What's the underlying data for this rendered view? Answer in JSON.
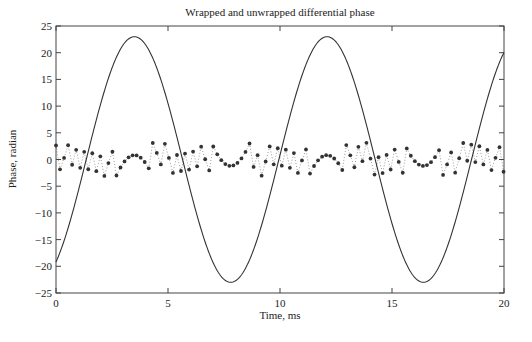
{
  "chart_data": {
    "type": "line",
    "title": "Wrapped and unwrapped differential phase",
    "xlabel": "Time, ms",
    "ylabel": "Phase, radian",
    "xlim": [
      0,
      20
    ],
    "ylim": [
      -25,
      25
    ],
    "xticks": [
      0,
      5,
      10,
      15,
      20
    ],
    "yticks": [
      25,
      20,
      15,
      10,
      5,
      0,
      -5,
      -10,
      -15,
      -20,
      -25
    ],
    "grid": false,
    "legend": null,
    "series": [
      {
        "name": "Unwrapped phase",
        "style": "solid line",
        "color": "#333333",
        "model": {
          "amplitude": 23,
          "period_ms": 8.6,
          "peak_time_ms": 3.5
        },
        "key_points": [
          {
            "x": 0,
            "y": -19.6
          },
          {
            "x": 3.5,
            "y": 22.8
          },
          {
            "x": 7.9,
            "y": -23.2
          },
          {
            "x": 12.1,
            "y": 22.8
          },
          {
            "x": 16.4,
            "y": -23.2
          },
          {
            "x": 20,
            "y": 19.6
          }
        ]
      },
      {
        "name": "Wrapped phase",
        "style": "dotted line with star markers",
        "color": "#333333",
        "range": [
          -3.14,
          3.14
        ],
        "sample_spacing_ms": 0.18,
        "wrap_offset": 2.95,
        "features": [
          {
            "x": 3.5,
            "desc": "smooth hump",
            "y": 1.0
          },
          {
            "x": 7.9,
            "desc": "smooth valley",
            "y": -1.4
          },
          {
            "x": 12.1,
            "desc": "smooth hump",
            "y": 1.0
          },
          {
            "x": 16.4,
            "desc": "smooth valley",
            "y": -1.4
          }
        ]
      }
    ]
  },
  "labels": {
    "title": "Wrapped and unwrapped differential phase",
    "xlabel": "Time, ms",
    "ylabel": "Phase, radian"
  }
}
